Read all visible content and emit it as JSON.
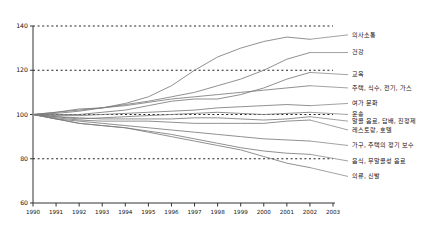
{
  "chart_data": {
    "type": "line",
    "title": "",
    "xlabel": "",
    "ylabel": "",
    "xlim": [
      1990,
      2003
    ],
    "ylim": [
      60,
      140
    ],
    "grid": true,
    "gridlines": [
      80,
      100,
      120,
      140
    ],
    "legend_position": "right-inline",
    "ytick_labels": [
      "140",
      "120",
      "100",
      "80",
      "60"
    ],
    "yticks": [
      140,
      120,
      100,
      80,
      60
    ],
    "x": [
      1990,
      1991,
      1992,
      1993,
      1994,
      1995,
      1996,
      1997,
      1998,
      1999,
      2000,
      2001,
      2002
    ],
    "xtick_labels": [
      "1990",
      "1991",
      "1992",
      "1993",
      "1994",
      "1995",
      "1996",
      "1997",
      "1998",
      "1999",
      "2000",
      "2001",
      "2002",
      "2003"
    ],
    "xticks": [
      1990,
      1991,
      1992,
      1993,
      1994,
      1995,
      1996,
      1997,
      1998,
      1999,
      2000,
      2001,
      2002,
      2003
    ],
    "series": [
      {
        "name": "의사소통",
        "label_y": 136,
        "values": [
          100,
          100.5,
          101.5,
          103,
          105,
          108,
          113,
          120,
          126,
          130,
          133,
          135,
          134
        ]
      },
      {
        "name": "건강",
        "label_y": 128,
        "values": [
          100,
          101,
          102,
          103,
          104.5,
          106,
          108,
          110,
          113,
          116,
          120,
          125,
          128
        ]
      },
      {
        "name": "교육",
        "label_y": 118,
        "values": [
          100,
          100,
          100,
          101,
          102,
          104,
          106,
          107,
          107,
          109,
          112,
          116,
          119
        ]
      },
      {
        "name": "주택, 식수, 전기, 가스",
        "label_y": 112,
        "values": [
          100,
          101,
          102.5,
          103,
          104,
          105.5,
          107,
          108,
          109,
          110,
          111,
          112,
          113
        ]
      },
      {
        "name": "여가 문화",
        "label_y": 105,
        "values": [
          100,
          99.5,
          99.5,
          100,
          100.5,
          101,
          101.5,
          102,
          103,
          103.5,
          104,
          104.5,
          104
        ]
      },
      {
        "name": "운송",
        "label_y": 100,
        "values": [
          100,
          99,
          98,
          98.5,
          99,
          99.5,
          100,
          100.5,
          101,
          100.5,
          100,
          100.5,
          101
        ]
      },
      {
        "name": "알콜 음료, 담배, 진정제",
        "label_y": 97,
        "values": [
          100,
          99,
          98.5,
          98,
          98,
          98,
          98,
          98.5,
          98.5,
          98,
          97.5,
          98,
          99
        ]
      },
      {
        "name": "레스토랑, 호텔",
        "label_y": 93,
        "values": [
          100,
          98.5,
          97.5,
          97,
          97,
          97,
          96.5,
          96,
          96,
          96,
          96,
          97,
          97.5
        ]
      },
      {
        "name": "가구, 주택의 정기 보수",
        "label_y": 86,
        "values": [
          100,
          98,
          97,
          96,
          95,
          94,
          93,
          92,
          91,
          90,
          89,
          88.5,
          88
        ]
      },
      {
        "name": "음식, 무알콜성 음료",
        "label_y": 79,
        "values": [
          100,
          98,
          96,
          95,
          94,
          92.5,
          91,
          89,
          87,
          85,
          83.5,
          82.5,
          82
        ]
      },
      {
        "name": "의류, 신발",
        "label_y": 72,
        "values": [
          100,
          98,
          96,
          95,
          94,
          92,
          90,
          88,
          86,
          84,
          81,
          78,
          76
        ]
      }
    ]
  }
}
